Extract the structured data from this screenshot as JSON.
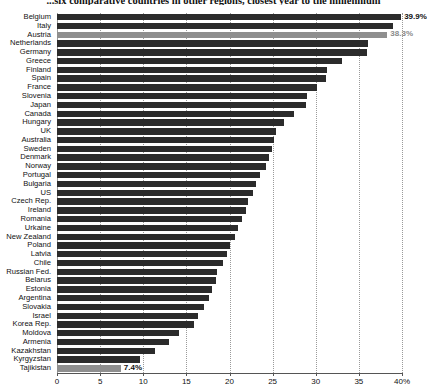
{
  "chart_data": {
    "type": "bar",
    "orientation": "horizontal",
    "title": "...six comparative countries in other regions, closest year to the millennium",
    "xlabel": "",
    "ylabel": "",
    "xlim": [
      0,
      40
    ],
    "xticks": [
      0,
      5,
      10,
      15,
      20,
      25,
      30,
      35,
      40
    ],
    "xtick_labels": [
      "0",
      "5",
      "10",
      "15",
      "20",
      "25",
      "30",
      "35",
      "40%"
    ],
    "grid": true,
    "grid_axis": "x",
    "legend": null,
    "bar_color": "#2b2b2b",
    "highlight_color": "#8f8f8f",
    "categories": [
      "Belgium",
      "Italy",
      "Austria",
      "Netherlands",
      "Germany",
      "Greece",
      "Finland",
      "Spain",
      "France",
      "Slovenia",
      "Japan",
      "Canada",
      "Hungary",
      "UK",
      "Australia",
      "Sweden",
      "Denmark",
      "Norway",
      "Portugal",
      "Bulgaria",
      "US",
      "Czech Rep.",
      "Ireland",
      "Romania",
      "Urkaine",
      "New Zealand",
      "Poland",
      "Latvia",
      "Chile",
      "Russian Fed.",
      "Belarus",
      "Estonia",
      "Argentina",
      "Slovakia",
      "Israel",
      "Korea Rep.",
      "Moldova",
      "Armenia",
      "Kazakhstan",
      "Kyrgyzstan",
      "Tajikistan"
    ],
    "values": [
      39.9,
      38.9,
      38.3,
      36.0,
      35.9,
      33.0,
      31.3,
      31.2,
      30.2,
      29.0,
      28.9,
      27.5,
      26.3,
      25.4,
      25.2,
      24.9,
      24.6,
      24.2,
      23.5,
      23.1,
      22.7,
      22.2,
      21.9,
      21.5,
      21.0,
      20.6,
      20.1,
      19.7,
      19.3,
      18.6,
      18.4,
      18.0,
      17.6,
      17.1,
      16.3,
      15.9,
      14.2,
      13.0,
      11.4,
      9.6,
      7.4
    ],
    "annotations": [
      {
        "category": "Belgium",
        "text": "39.9%",
        "style": "bold-dark"
      },
      {
        "category": "Austria",
        "text": "38.3%",
        "style": "muted-gray"
      },
      {
        "category": "Tajikistan",
        "text": "7.4%",
        "style": "bold-dark"
      }
    ],
    "highlighted_categories": [
      "Austria",
      "Tajikistan"
    ]
  }
}
